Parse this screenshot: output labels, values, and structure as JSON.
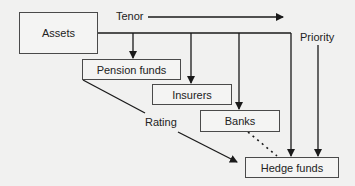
{
  "diagram": {
    "nodes": {
      "assets": "Assets",
      "pension_funds": "Pension funds",
      "insurers": "Insurers",
      "banks": "Banks",
      "hedge_funds": "Hedge funds"
    },
    "axis_labels": {
      "tenor": "Tenor",
      "priority": "Priority",
      "rating": "Rating"
    },
    "edges": [
      {
        "from": "assets",
        "to": "pension_funds",
        "style": "solid-arrow"
      },
      {
        "from": "assets",
        "to": "insurers",
        "style": "solid-arrow"
      },
      {
        "from": "assets",
        "to": "banks",
        "style": "solid-arrow"
      },
      {
        "from": "assets",
        "to": "hedge_funds",
        "style": "solid-arrow"
      },
      {
        "from": "banks",
        "to": "hedge_funds",
        "style": "dotted"
      },
      {
        "from": "pension_funds",
        "to": "hedge_funds",
        "label": "Rating",
        "style": "solid-arrow"
      },
      {
        "from": "priority",
        "to": "hedge_funds",
        "style": "solid-arrow"
      },
      {
        "from": "tenor",
        "to": "right",
        "style": "solid-arrow"
      }
    ],
    "colors": {
      "background": "#f1f1f0",
      "line": "#1a1a1a",
      "box_border": "#4a4a4a"
    }
  }
}
